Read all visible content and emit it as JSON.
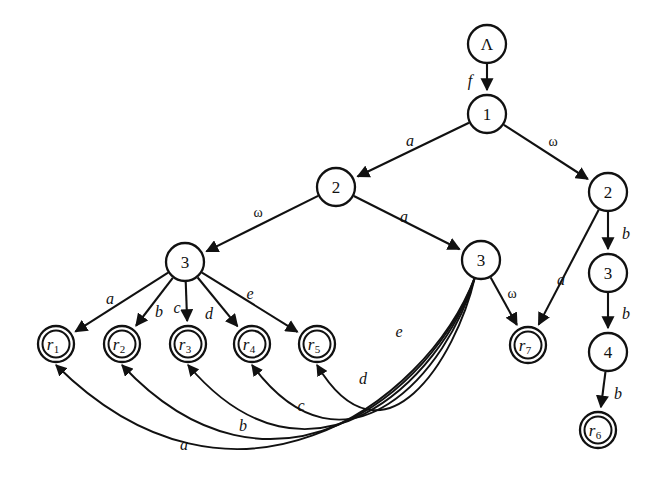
{
  "figure": {
    "kind": "automaton-transition-diagram",
    "background": "#ffffff",
    "stroke_color": "#111111",
    "width": 667,
    "height": 486
  },
  "nodes": [
    {
      "id": "root",
      "label": "Λ",
      "sub": "",
      "x": 487,
      "y": 44,
      "r": 19,
      "accepting": false
    },
    {
      "id": "n1",
      "label": "1",
      "sub": "",
      "x": 487,
      "y": 114,
      "r": 19,
      "accepting": false
    },
    {
      "id": "n2L",
      "label": "2",
      "sub": "",
      "x": 336,
      "y": 187,
      "r": 19,
      "accepting": false
    },
    {
      "id": "n2R",
      "label": "2",
      "sub": "",
      "x": 608,
      "y": 192,
      "r": 19,
      "accepting": false
    },
    {
      "id": "n3L",
      "label": "3",
      "sub": "",
      "x": 185,
      "y": 262,
      "r": 19,
      "accepting": false
    },
    {
      "id": "n3M",
      "label": "3",
      "sub": "",
      "x": 481,
      "y": 260,
      "r": 19,
      "accepting": false
    },
    {
      "id": "n3R",
      "label": "3",
      "sub": "",
      "x": 608,
      "y": 273,
      "r": 19,
      "accepting": false
    },
    {
      "id": "n4R",
      "label": "4",
      "sub": "",
      "x": 608,
      "y": 352,
      "r": 19,
      "accepting": false
    },
    {
      "id": "r1",
      "label": "r",
      "sub": "1",
      "x": 56,
      "y": 344,
      "r": 18,
      "accepting": true
    },
    {
      "id": "r2",
      "label": "r",
      "sub": "2",
      "x": 122,
      "y": 344,
      "r": 18,
      "accepting": true
    },
    {
      "id": "r3",
      "label": "r",
      "sub": "3",
      "x": 188,
      "y": 344,
      "r": 18,
      "accepting": true
    },
    {
      "id": "r4",
      "label": "r",
      "sub": "4",
      "x": 252,
      "y": 344,
      "r": 18,
      "accepting": true
    },
    {
      "id": "r5",
      "label": "r",
      "sub": "5",
      "x": 317,
      "y": 344,
      "r": 18,
      "accepting": true
    },
    {
      "id": "r6",
      "label": "r",
      "sub": "6",
      "x": 598,
      "y": 430,
      "r": 18,
      "accepting": true
    },
    {
      "id": "r7",
      "label": "r",
      "sub": "7",
      "x": 528,
      "y": 345,
      "r": 18,
      "accepting": true
    }
  ],
  "edges": [
    {
      "id": "e-root-1",
      "from": "root",
      "to": "n1",
      "label": "f",
      "greek": false,
      "label_x": 470,
      "label_y": 80,
      "kind": "straight"
    },
    {
      "id": "e-1-2L",
      "from": "n1",
      "to": "n2L",
      "label": "a",
      "greek": false,
      "label_x": 410,
      "label_y": 140,
      "kind": "straight"
    },
    {
      "id": "e-1-2R",
      "from": "n1",
      "to": "n2R",
      "label": "ω",
      "greek": true,
      "label_x": 553,
      "label_y": 141,
      "kind": "straight"
    },
    {
      "id": "e-2L-3L",
      "from": "n2L",
      "to": "n3L",
      "label": "ω",
      "greek": true,
      "label_x": 258,
      "label_y": 212,
      "kind": "straight"
    },
    {
      "id": "e-2L-3M",
      "from": "n2L",
      "to": "n3M",
      "label": "a",
      "greek": false,
      "label_x": 404,
      "label_y": 216,
      "kind": "straight"
    },
    {
      "id": "e-2R-r7",
      "from": "n2R",
      "to": "r7",
      "label": "a",
      "greek": false,
      "label_x": 561,
      "label_y": 279,
      "kind": "straight"
    },
    {
      "id": "e-2R-3R",
      "from": "n2R",
      "to": "n3R",
      "label": "b",
      "greek": false,
      "label_x": 626,
      "label_y": 233,
      "kind": "straight"
    },
    {
      "id": "e-3R-4R",
      "from": "n3R",
      "to": "n4R",
      "label": "b",
      "greek": false,
      "label_x": 626,
      "label_y": 313,
      "kind": "straight"
    },
    {
      "id": "e-4R-r6",
      "from": "n4R",
      "to": "r6",
      "label": "b",
      "greek": false,
      "label_x": 618,
      "label_y": 393,
      "kind": "straight"
    },
    {
      "id": "e-3L-r1",
      "from": "n3L",
      "to": "r1",
      "label": "a",
      "greek": false,
      "label_x": 110,
      "label_y": 298,
      "kind": "straight"
    },
    {
      "id": "e-3L-r2",
      "from": "n3L",
      "to": "r2",
      "label": "b",
      "greek": false,
      "label_x": 159,
      "label_y": 311,
      "kind": "straight"
    },
    {
      "id": "e-3L-r3",
      "from": "n3L",
      "to": "r3",
      "label": "c",
      "greek": false,
      "label_x": 177,
      "label_y": 307,
      "kind": "straight"
    },
    {
      "id": "e-3L-r4",
      "from": "n3L",
      "to": "r4",
      "label": "d",
      "greek": false,
      "label_x": 209,
      "label_y": 313,
      "kind": "straight"
    },
    {
      "id": "e-3L-r5",
      "from": "n3L",
      "to": "r5",
      "label": "e",
      "greek": false,
      "label_x": 250,
      "label_y": 293,
      "kind": "straight"
    },
    {
      "id": "e-3M-r7",
      "from": "n3M",
      "to": "r7",
      "label": "ω",
      "greek": true,
      "label_x": 512,
      "label_y": 293,
      "kind": "straight"
    },
    {
      "id": "e-3M-r5",
      "from": "n3M",
      "to": "r5",
      "label": "e",
      "greek": false,
      "label_x": 399,
      "label_y": 331,
      "kind": "curve"
    },
    {
      "id": "e-3M-r4",
      "from": "n3M",
      "to": "r4",
      "label": "d",
      "greek": false,
      "label_x": 363,
      "label_y": 378,
      "kind": "curve"
    },
    {
      "id": "e-3M-r3",
      "from": "n3M",
      "to": "r3",
      "label": "c",
      "greek": false,
      "label_x": 301,
      "label_y": 405,
      "kind": "curve"
    },
    {
      "id": "e-3M-r2",
      "from": "n3M",
      "to": "r2",
      "label": "b",
      "greek": false,
      "label_x": 243,
      "label_y": 425,
      "kind": "curve"
    },
    {
      "id": "e-3M-r1",
      "from": "n3M",
      "to": "r1",
      "label": "a",
      "greek": false,
      "label_x": 184,
      "label_y": 444,
      "kind": "curve"
    }
  ]
}
